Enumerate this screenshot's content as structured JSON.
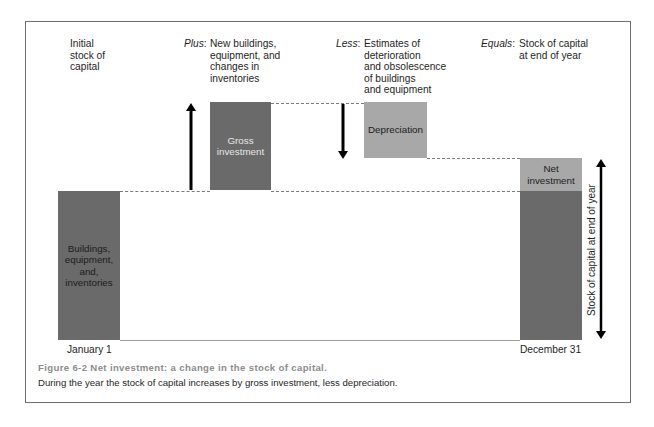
{
  "labels": {
    "initial": [
      "Initial",
      "stock of",
      "capital"
    ],
    "plus": {
      "prefix": "Plus",
      "lines": [
        "New buildings,",
        "equipment, and",
        "changes in",
        "inventories"
      ]
    },
    "less": {
      "prefix": "Less",
      "lines": [
        "Estimates of",
        "deterioration",
        "and obsolescence",
        "of buildings",
        "and equipment"
      ]
    },
    "equals": {
      "prefix": "Equals",
      "lines": [
        "Stock of capital",
        "at end of year"
      ]
    }
  },
  "bars": {
    "buildings": [
      "Buildings,",
      "equipment,",
      "and,",
      "inventories"
    ],
    "gross": [
      "Gross",
      "investment"
    ],
    "depreciation": "Depreciation",
    "net": [
      "Net",
      "investment"
    ]
  },
  "vertical_label": "Stock of capital at end of year",
  "dates": {
    "start": "January 1",
    "end": "December 31"
  },
  "caption": {
    "title": "Figure 6-2   Net investment: a change in the stock of capital.",
    "text": "During the year the stock of capital increases by gross investment, less depreciation."
  },
  "colors": {
    "dark_bar": "#6a6a6a",
    "light_bar": "#a8a8a8",
    "frame": "#6e6e6e",
    "caption_title": "#8c8c8c"
  }
}
